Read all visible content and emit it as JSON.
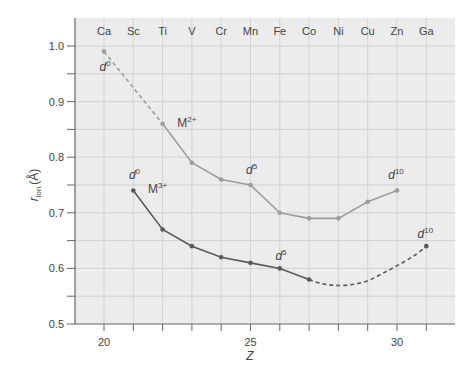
{
  "chart_data": {
    "type": "line",
    "title": "",
    "xlabel": "Z",
    "ylabel": "r_ion (Å)",
    "ylabel_main": "r",
    "ylabel_sub": "ion",
    "ylabel_unit": "(Å)",
    "xlim": [
      19,
      31.8
    ],
    "ylim": [
      0.5,
      1.04
    ],
    "x_ticks": [
      20,
      21,
      22,
      23,
      24,
      25,
      26,
      27,
      28,
      29,
      30,
      31
    ],
    "x_tick_labels": [
      {
        "z": 20,
        "label": "20"
      },
      {
        "z": 25,
        "label": "25"
      },
      {
        "z": 30,
        "label": "30"
      }
    ],
    "y_ticks": [
      0.5,
      0.55,
      0.6,
      0.65,
      0.7,
      0.75,
      0.8,
      0.85,
      0.9,
      0.95,
      1.0
    ],
    "y_tick_labels": [
      {
        "v": 0.5,
        "label": "0.5"
      },
      {
        "v": 0.6,
        "label": "0.6"
      },
      {
        "v": 0.7,
        "label": "0.7"
      },
      {
        "v": 0.8,
        "label": "0.8"
      },
      {
        "v": 0.9,
        "label": "0.9"
      },
      {
        "v": 1.0,
        "label": "1.0"
      }
    ],
    "grid": true,
    "element_labels": [
      {
        "z": 20,
        "symbol": "Ca"
      },
      {
        "z": 21,
        "symbol": "Sc"
      },
      {
        "z": 22,
        "symbol": "Ti"
      },
      {
        "z": 23,
        "symbol": "V"
      },
      {
        "z": 24,
        "symbol": "Cr"
      },
      {
        "z": 25,
        "symbol": "Mn"
      },
      {
        "z": 26,
        "symbol": "Fe"
      },
      {
        "z": 27,
        "symbol": "Co"
      },
      {
        "z": 28,
        "symbol": "Ni"
      },
      {
        "z": 29,
        "symbol": "Cu"
      },
      {
        "z": 30,
        "symbol": "Zn"
      },
      {
        "z": 31,
        "symbol": "Ga"
      }
    ],
    "series": [
      {
        "name": "M2+",
        "label_base": "M",
        "label_sup": "2+",
        "color": "#9e9e9e",
        "points": [
          {
            "z": 20,
            "r": 0.99
          },
          {
            "z": 22,
            "r": 0.86
          },
          {
            "z": 23,
            "r": 0.79
          },
          {
            "z": 24,
            "r": 0.76
          },
          {
            "z": 25,
            "r": 0.75
          },
          {
            "z": 26,
            "r": 0.7
          },
          {
            "z": 27,
            "r": 0.69
          },
          {
            "z": 28,
            "r": 0.69
          },
          {
            "z": 29,
            "r": 0.72
          },
          {
            "z": 30,
            "r": 0.74
          }
        ],
        "dashed_segment": {
          "from_z": 20,
          "to_z": 22
        }
      },
      {
        "name": "M3+",
        "label_base": "M",
        "label_sup": "3+",
        "color": "#5a5a5a",
        "points": [
          {
            "z": 21,
            "r": 0.74
          },
          {
            "z": 22,
            "r": 0.67
          },
          {
            "z": 23,
            "r": 0.64
          },
          {
            "z": 24,
            "r": 0.62
          },
          {
            "z": 25,
            "r": 0.61
          },
          {
            "z": 26,
            "r": 0.6
          },
          {
            "z": 27,
            "r": 0.58
          },
          {
            "z": 31,
            "r": 0.64
          }
        ],
        "dashed_segment": {
          "from_z": 27,
          "to_z": 31,
          "curve_min": {
            "z": 28,
            "r": 0.57
          }
        }
      }
    ],
    "annotations": [
      {
        "text": "d",
        "sup": "0",
        "z": 19.85,
        "r": 0.955,
        "series": "M2+"
      },
      {
        "text": "d",
        "sup": "10",
        "z": 29.7,
        "r": 0.76,
        "series": "M2+"
      },
      {
        "text": "d",
        "sup": "5",
        "z": 24.85,
        "r": 0.77,
        "series": "M2+"
      },
      {
        "text": "d",
        "sup": "0",
        "z": 20.85,
        "r": 0.76,
        "series": "M3+"
      },
      {
        "text": "d",
        "sup": "5",
        "z": 25.85,
        "r": 0.615,
        "series": "M3+"
      },
      {
        "text": "d",
        "sup": "10",
        "z": 30.7,
        "r": 0.655,
        "series": "M3+"
      },
      {
        "text": "M",
        "sup": "2+",
        "z": 22.5,
        "r": 0.855,
        "series": "M2+"
      },
      {
        "text": "M",
        "sup": "3+",
        "z": 21.5,
        "r": 0.735,
        "series": "M3+"
      }
    ]
  },
  "colors": {
    "plot_background": "#ececec",
    "grid": "#d2d2d2",
    "axis": "#666666",
    "text": "#444444"
  }
}
